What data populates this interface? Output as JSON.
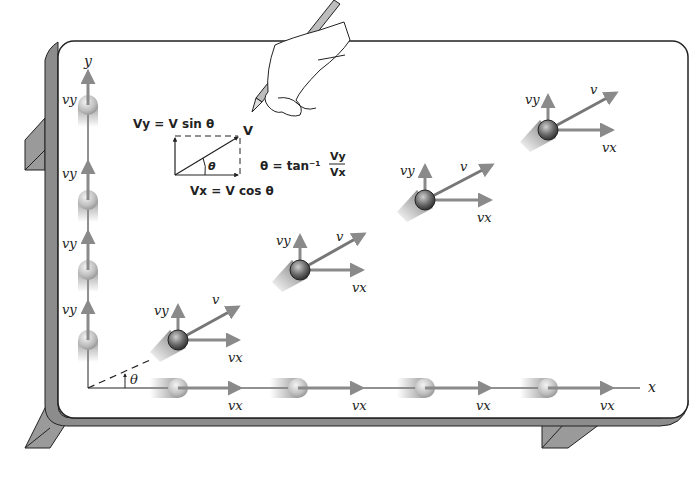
{
  "figure": {
    "axes": {
      "x_label": "x",
      "y_label": "y",
      "angle_label": "θ"
    },
    "colors": {
      "board_fill": "#ffffff",
      "board_edge": "#8c8c8c",
      "board_outline": "#222222",
      "arrow_gray": "#8a8a8a",
      "ball_dark": "#555555",
      "ball_light": "#cfcfcf",
      "text": "#222222"
    },
    "equations": {
      "vy": "Vy = V sin θ",
      "vx": "Vx = V cos θ",
      "theta": "θ = tan⁻¹",
      "theta_num": "Vy",
      "theta_den": "Vx",
      "v_label": "V",
      "angle": "θ"
    },
    "vertical_column": {
      "label": "vy",
      "balls": [
        {
          "cy": 105
        },
        {
          "cy": 200
        },
        {
          "cy": 270
        },
        {
          "cy": 340
        }
      ]
    },
    "projectile": {
      "labels": {
        "v": "v",
        "vx": "vx",
        "vy": "vy"
      },
      "balls": [
        {
          "cx": 178,
          "cy": 340
        },
        {
          "cx": 300,
          "cy": 270
        },
        {
          "cx": 425,
          "cy": 200
        },
        {
          "cx": 548,
          "cy": 130
        }
      ]
    },
    "horizontal_row": {
      "label": "vx",
      "balls": [
        {
          "cx": 178,
          "cy": 388
        },
        {
          "cx": 298,
          "cy": 388
        },
        {
          "cx": 425,
          "cy": 388
        },
        {
          "cx": 548,
          "cy": 388
        }
      ]
    }
  }
}
